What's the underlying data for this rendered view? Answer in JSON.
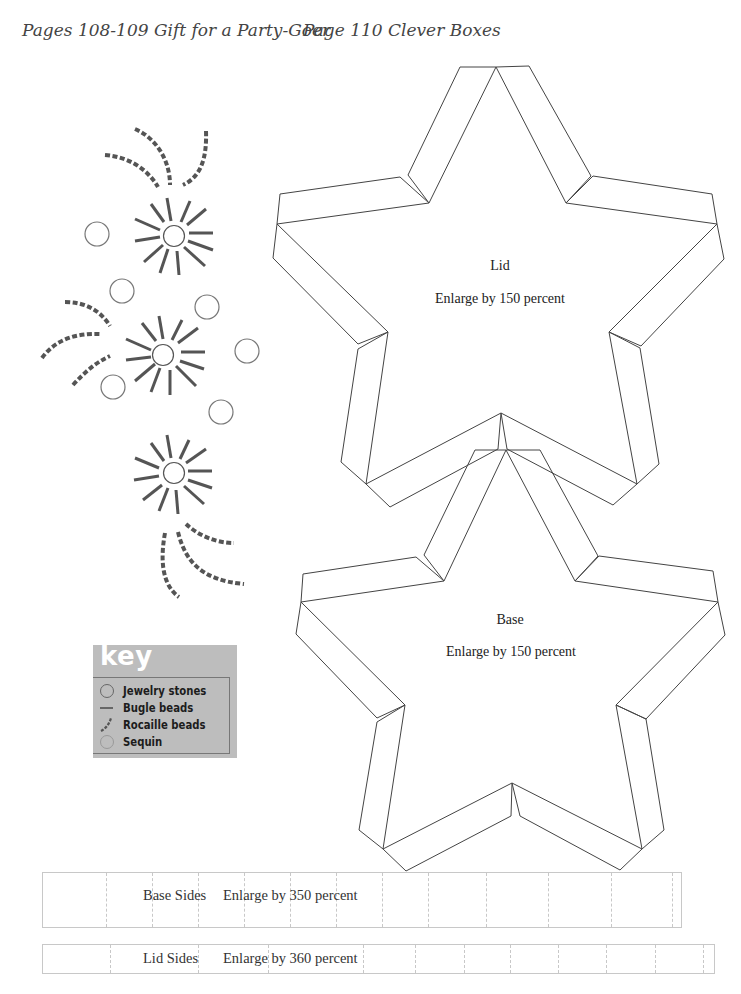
{
  "header": {
    "left_title": "Pages 108-109 Gift for a Party-Goer",
    "right_title": "Page 110 Clever Boxes"
  },
  "templates": {
    "lid": {
      "name": "Lid",
      "instruction": "Enlarge by 150 percent"
    },
    "base": {
      "name": "Base",
      "instruction": "Enlarge by 150 percent"
    },
    "base_sides": {
      "name": "Base Sides",
      "instruction": "Enlarge by 350 percent"
    },
    "lid_sides": {
      "name": "Lid Sides",
      "instruction": "Enlarge by 360 percent"
    }
  },
  "key": {
    "title": "key",
    "items": [
      {
        "icon": "jewelry-stone-circle-icon",
        "label": "Jewelry stones"
      },
      {
        "icon": "bugle-bead-line-icon",
        "label": "Bugle beads"
      },
      {
        "icon": "rocaille-bead-dashed-icon",
        "label": "Rocaille beads"
      },
      {
        "icon": "sequin-circle-icon",
        "label": "Sequin"
      }
    ]
  },
  "colors": {
    "bead": "#555555",
    "outline": "#333333",
    "key_bg": "#bdbdbd",
    "key_title": "#ffffff",
    "strip_line": "#c8c8c8"
  }
}
